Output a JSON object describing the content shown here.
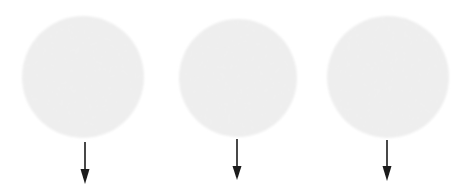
{
  "figure": {
    "title": "Three circular grain discs with downward arrows",
    "width": 470,
    "height": 191,
    "background_color": "#ffffff",
    "disc_fill_color": "#d8d8d8",
    "disc_noise_light": "#e6e6e6",
    "disc_noise_dark": "#c9c9c9",
    "arrow_color": "#1a1a1a",
    "item_count": 3
  },
  "items": [
    {
      "id": "item-1",
      "label": "",
      "disc": {
        "name": "grain-disc-1",
        "cx": 83,
        "cy": 77,
        "r": 61,
        "fill": "#d8d8d8"
      },
      "arrow": {
        "name": "down-arrow-1",
        "x": 85,
        "y_start": 142,
        "y_tip": 184,
        "shaft_width": 1.6,
        "head_width": 9,
        "head_length": 15,
        "color": "#1a1a1a",
        "direction": "down"
      }
    },
    {
      "id": "item-2",
      "label": "",
      "disc": {
        "name": "grain-disc-2",
        "cx": 238,
        "cy": 78,
        "r": 59,
        "fill": "#d8d8d8"
      },
      "arrow": {
        "name": "down-arrow-2",
        "x": 237,
        "y_start": 139,
        "y_tip": 180,
        "shaft_width": 1.6,
        "head_width": 9,
        "head_length": 14,
        "color": "#1a1a1a",
        "direction": "down"
      }
    },
    {
      "id": "item-3",
      "label": "",
      "disc": {
        "name": "grain-disc-3",
        "cx": 388,
        "cy": 77,
        "r": 61,
        "fill": "#d8d8d8"
      },
      "arrow": {
        "name": "down-arrow-3",
        "x": 387,
        "y_start": 140,
        "y_tip": 181,
        "shaft_width": 1.6,
        "head_width": 9,
        "head_length": 15,
        "color": "#1a1a1a",
        "direction": "down"
      }
    }
  ]
}
